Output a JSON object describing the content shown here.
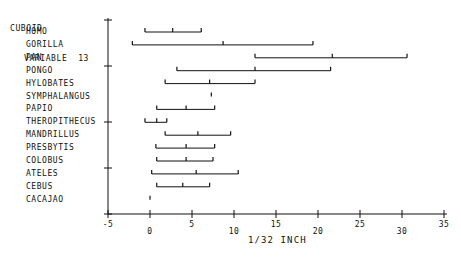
{
  "header": {
    "line1": "CUBOID",
    "line2": "VARIABLE  13"
  },
  "axis": {
    "x_label": "1/32 INCH",
    "x_ticks": [
      {
        "value": -5,
        "label": "-5"
      },
      {
        "value": 0,
        "label": "0"
      },
      {
        "value": 5,
        "label": "5"
      },
      {
        "value": 10,
        "label": "10"
      },
      {
        "value": 15,
        "label": "15"
      },
      {
        "value": 20,
        "label": "20"
      },
      {
        "value": 25,
        "label": "25"
      },
      {
        "value": 30,
        "label": "30"
      },
      {
        "value": 35,
        "label": "35"
      }
    ]
  },
  "chart_data": {
    "type": "range-plot",
    "title": "CUBOID VARIABLE 13",
    "xlabel": "1/32 INCH",
    "ylabel": "",
    "xlim": [
      -5,
      35
    ],
    "grid": false,
    "legend": null,
    "categories": [
      "HOMO",
      "GORILLA",
      "PAN",
      "PONGO",
      "HYLOBATES",
      "SYMPHALANGUS",
      "PAPIO",
      "THEROPITHECUS",
      "MANDRILLUS",
      "PRESBYTIS",
      "COLOBUS",
      "ATELES",
      "CEBUS",
      "CACAJAO"
    ],
    "series": [
      {
        "name": "HOMO",
        "min": -0.6,
        "mid": 2.7,
        "max": 6.1
      },
      {
        "name": "GORILLA",
        "min": -2.1,
        "mid": 8.7,
        "max": 19.4
      },
      {
        "name": "PAN",
        "min": 12.5,
        "mid": 21.7,
        "max": 30.6
      },
      {
        "name": "PONGO",
        "min": 3.2,
        "mid": 12.5,
        "max": 21.5
      },
      {
        "name": "HYLOBATES",
        "min": 1.8,
        "mid": 7.1,
        "max": 12.5
      },
      {
        "name": "SYMPHALANGUS",
        "min": 7.3,
        "mid": 7.3,
        "max": 7.3
      },
      {
        "name": "PAPIO",
        "min": 0.8,
        "mid": 4.3,
        "max": 7.7
      },
      {
        "name": "THEROPITHECUS",
        "min": -0.6,
        "mid": 0.8,
        "max": 2.0
      },
      {
        "name": "MANDRILLUS",
        "min": 1.8,
        "mid": 5.7,
        "max": 9.6
      },
      {
        "name": "PRESBYTIS",
        "min": 0.7,
        "mid": 4.3,
        "max": 7.7
      },
      {
        "name": "COLOBUS",
        "min": 0.8,
        "mid": 4.3,
        "max": 7.5
      },
      {
        "name": "ATELES",
        "min": 0.2,
        "mid": 5.5,
        "max": 10.5
      },
      {
        "name": "CEBUS",
        "min": 0.8,
        "mid": 3.9,
        "max": 7.1
      },
      {
        "name": "CACAJAO",
        "min": 0.0,
        "mid": 0.0,
        "max": 0.0
      }
    ]
  }
}
